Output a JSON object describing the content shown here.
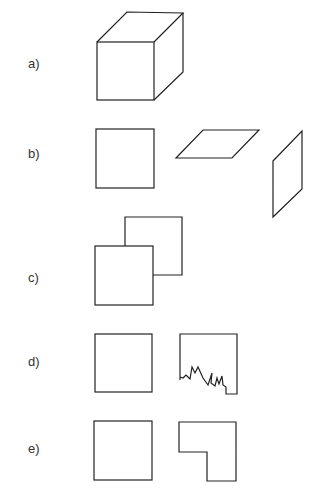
{
  "figure": {
    "rows": [
      {
        "label": "a)",
        "description": "cube in perspective"
      },
      {
        "label": "b)",
        "description": "square, horizontal parallelogram, vertical parallelogram"
      },
      {
        "label": "c)",
        "description": "two overlapping squares"
      },
      {
        "label": "d)",
        "description": "square and square with torn bottom edge"
      },
      {
        "label": "e)",
        "description": "square and L-shape"
      }
    ]
  }
}
